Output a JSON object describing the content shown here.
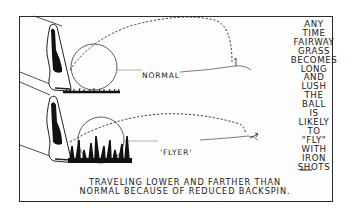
{
  "illustration": {
    "panels": [
      {
        "id": "normal",
        "label": "NORMAL"
      },
      {
        "id": "flyer",
        "label": "'FLYER'"
      }
    ],
    "side_text_lines": [
      "ANY",
      "TIME",
      "FAIRWAY",
      "GRASS",
      "BECOMES",
      "LONG",
      "AND",
      "LUSH",
      "THE",
      "BALL",
      "IS",
      "LIKELY",
      "TO",
      "\"FLY\"",
      "WITH",
      "IRON",
      "SHOTS",
      "—"
    ],
    "caption_lines": [
      "TRAVELING LOWER AND FARTHER THAN",
      "NORMAL BECAUSE OF REDUCED BACKSPIN."
    ],
    "colors": {
      "ink": "#1a1a1a",
      "paper": "#ffffff"
    }
  }
}
